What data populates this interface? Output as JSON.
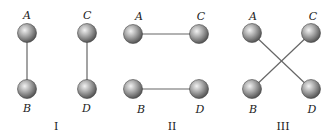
{
  "diagram": {
    "panels": [
      {
        "id": "I",
        "label": "I",
        "balls": [
          {
            "name": "A",
            "x": 27,
            "y": 33
          },
          {
            "name": "B",
            "x": 27,
            "y": 89
          },
          {
            "name": "C",
            "x": 87,
            "y": 33
          },
          {
            "name": "D",
            "x": 87,
            "y": 89
          }
        ],
        "connections": [
          [
            "A",
            "B"
          ],
          [
            "C",
            "D"
          ]
        ]
      },
      {
        "id": "II",
        "label": "II",
        "balls": [
          {
            "name": "A",
            "x": 133,
            "y": 34
          },
          {
            "name": "C",
            "x": 199,
            "y": 34
          },
          {
            "name": "B",
            "x": 133,
            "y": 89
          },
          {
            "name": "D",
            "x": 199,
            "y": 89
          }
        ],
        "connections": [
          [
            "A",
            "C"
          ],
          [
            "B",
            "D"
          ]
        ]
      },
      {
        "id": "III",
        "label": "III",
        "balls": [
          {
            "name": "A",
            "x": 252,
            "y": 33
          },
          {
            "name": "C",
            "x": 311,
            "y": 33
          },
          {
            "name": "B",
            "x": 252,
            "y": 89
          },
          {
            "name": "D",
            "x": 311,
            "y": 89
          }
        ],
        "connections": [
          [
            "A",
            "D"
          ],
          [
            "C",
            "B"
          ]
        ]
      }
    ],
    "colors": {
      "ball_light": "#eeeeee",
      "ball_dark": "#555555",
      "rod": "#666666",
      "text": "#222222"
    }
  }
}
